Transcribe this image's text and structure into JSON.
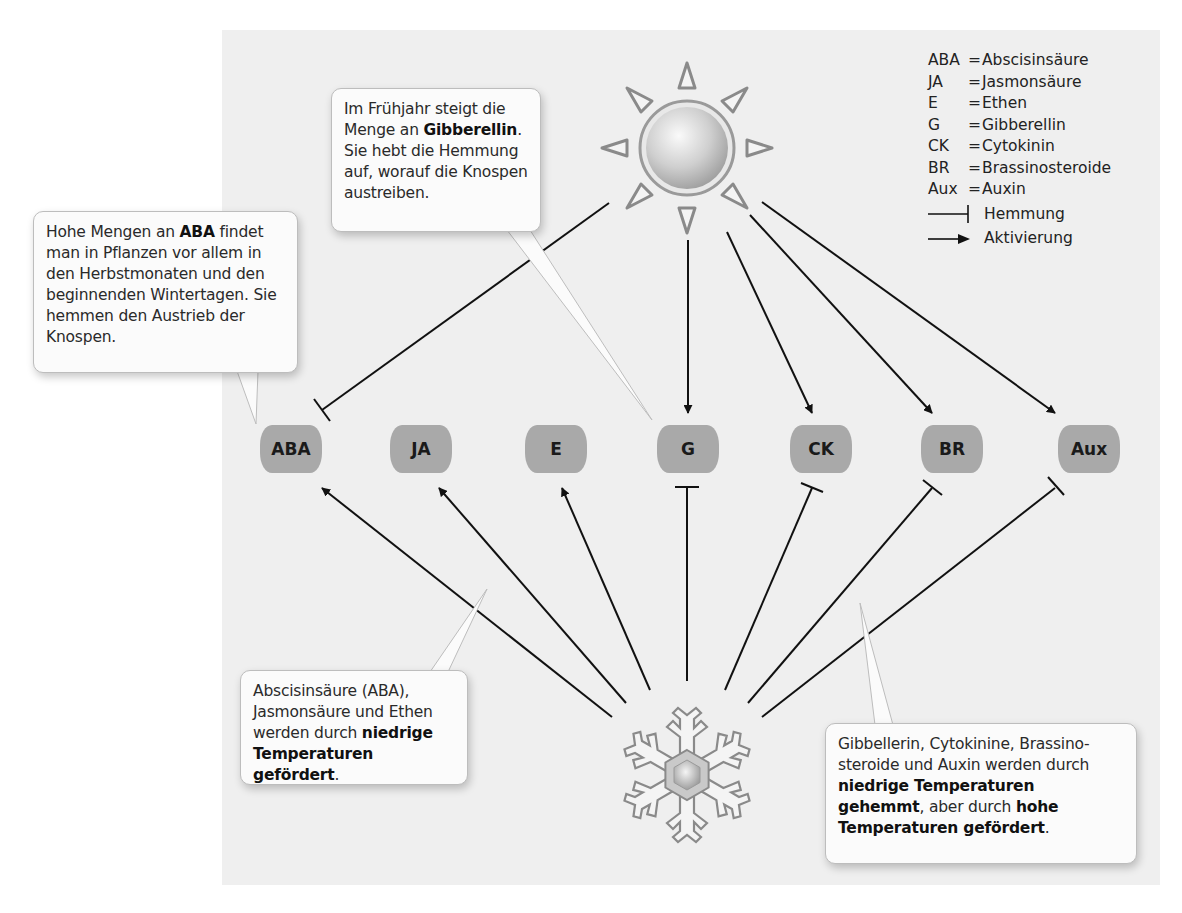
{
  "legend": {
    "entries": [
      {
        "abbr": "ABA",
        "eq": "=",
        "name": "Abscisinsäure"
      },
      {
        "abbr": "JA",
        "eq": "=",
        "name": "Jasmonsäure"
      },
      {
        "abbr": "E",
        "eq": "=",
        "name": "Ethen"
      },
      {
        "abbr": "G",
        "eq": "=",
        "name": "Gibberellin"
      },
      {
        "abbr": "CK",
        "eq": "=",
        "name": "Cytokinin"
      },
      {
        "abbr": "BR",
        "eq": "=",
        "name": "Brassinosteroide"
      },
      {
        "abbr": "Aux",
        "eq": "=",
        "name": "Auxin"
      }
    ],
    "inhibition_label": "Hemmung",
    "activation_label": "Aktivierung"
  },
  "nodes": [
    {
      "id": "ABA",
      "label": "ABA",
      "x": 260
    },
    {
      "id": "JA",
      "label": "JA",
      "x": 390
    },
    {
      "id": "E",
      "label": "E",
      "x": 525
    },
    {
      "id": "G",
      "label": "G",
      "x": 657
    },
    {
      "id": "CK",
      "label": "CK",
      "x": 790
    },
    {
      "id": "BR",
      "label": "BR",
      "x": 921
    },
    {
      "id": "Aux",
      "label": "Aux",
      "x": 1058
    }
  ],
  "sources": {
    "sun": {
      "icon": "sun-icon",
      "meaning": "hohe Temperaturen"
    },
    "snowflake": {
      "icon": "snowflake-icon",
      "meaning": "niedrige Temperaturen"
    }
  },
  "edges": [
    {
      "from": "sun",
      "to": "ABA",
      "type": "inhibition"
    },
    {
      "from": "sun",
      "to": "G",
      "type": "activation"
    },
    {
      "from": "sun",
      "to": "CK",
      "type": "activation"
    },
    {
      "from": "sun",
      "to": "BR",
      "type": "activation"
    },
    {
      "from": "sun",
      "to": "Aux",
      "type": "activation"
    },
    {
      "from": "snowflake",
      "to": "ABA",
      "type": "activation"
    },
    {
      "from": "snowflake",
      "to": "JA",
      "type": "activation"
    },
    {
      "from": "snowflake",
      "to": "E",
      "type": "activation"
    },
    {
      "from": "snowflake",
      "to": "G",
      "type": "inhibition"
    },
    {
      "from": "snowflake",
      "to": "CK",
      "type": "inhibition"
    },
    {
      "from": "snowflake",
      "to": "BR",
      "type": "inhibition"
    },
    {
      "from": "snowflake",
      "to": "Aux",
      "type": "inhibition"
    }
  ],
  "callouts": {
    "aba": {
      "t1": "Hohe Mengen an ",
      "b1": "ABA",
      "t2": " findet man in Pflanzen vor allem in den Herbstmonaten und den beginnenden Wintertagen. Sie hemmen den Austrieb der Knospen."
    },
    "gibberellin": {
      "t1": "Im Frühjahr steigt die Menge an ",
      "b1": "Gibberellin",
      "t2": ". Sie hebt die Hemmung auf, worauf die Knos­pen austreiben."
    },
    "cold_promoted": {
      "t1": "Abscisinsäure (ABA), Jasmonsäure und Ethen werden durch ",
      "b1": "niedrige Temperaturen gefördert",
      "t2": "."
    },
    "cold_inhibited": {
      "t1": "Gibbellerin, Cytokinine, Brassino­steroide und Auxin werden durch ",
      "b1": "niedrige Temperaturen gehemmt",
      "t2": ", aber durch ",
      "b2": "hohe Temperaturen gefördert",
      "t3": "."
    }
  }
}
